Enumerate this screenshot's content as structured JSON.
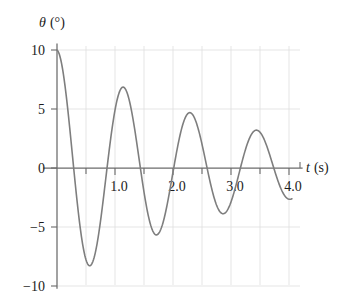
{
  "chart_data": {
    "type": "line",
    "title": "",
    "subtitle": "",
    "xlabel": "t (s)",
    "ylabel": "θ (°)",
    "xlabel_symbol": "t",
    "xlabel_unit": "(s)",
    "ylabel_symbol": "θ",
    "ylabel_unit": "(°)",
    "xlim": [
      0,
      4.35
    ],
    "ylim": [
      -10.6,
      10.6
    ],
    "grid": true,
    "grid_style": "light vertical lines every 0.5 s and light horizontal lines at each labeled theta value",
    "legend": "none",
    "legend_position": "none",
    "curve_color": "#7e7e7e",
    "axis_color": "#6b6b6b",
    "grid_color": "#dedede",
    "x_ticks_major": [
      1.0,
      2.0,
      3.0,
      4.0
    ],
    "x_tick_labels": [
      "1.0",
      "2.0",
      "3.0",
      "4.0"
    ],
    "x_ticks_minor": [
      0.5,
      1.5,
      2.5,
      3.5
    ],
    "y_ticks": [
      10,
      5,
      0,
      -5,
      -10
    ],
    "y_tick_labels": [
      "10",
      "5",
      "0",
      "−5",
      "−10"
    ],
    "model": "theta(t) = 10 * exp(-0.33 t) * cos(2*pi*t/1.15)",
    "amplitude_initial": 10,
    "period": 1.15,
    "decay_constant": 0.33,
    "extrema": [
      {
        "t": 0.0,
        "theta": 10.0,
        "kind": "start-peak"
      },
      {
        "t": 0.57,
        "theta": -9.1,
        "kind": "trough"
      },
      {
        "t": 1.13,
        "theta": 7.4,
        "kind": "peak"
      },
      {
        "t": 1.72,
        "theta": -6.8,
        "kind": "trough"
      },
      {
        "t": 2.3,
        "theta": 5.3,
        "kind": "peak"
      },
      {
        "t": 2.87,
        "theta": -5.2,
        "kind": "trough"
      },
      {
        "t": 3.44,
        "theta": 3.8,
        "kind": "peak"
      },
      {
        "t": 4.05,
        "theta": -3.8,
        "kind": "end"
      }
    ],
    "zero_crossings": [
      0.29,
      0.86,
      1.43,
      2.01,
      2.58,
      3.15,
      3.73
    ],
    "x": [
      0.0,
      0.05,
      0.1,
      0.15,
      0.2,
      0.25,
      0.3,
      0.35,
      0.4,
      0.45,
      0.5,
      0.55,
      0.6,
      0.65,
      0.7,
      0.75,
      0.8,
      0.85,
      0.9,
      0.95,
      1.0,
      1.05,
      1.1,
      1.15,
      1.2,
      1.25,
      1.3,
      1.35,
      1.4,
      1.45,
      1.5,
      1.55,
      1.6,
      1.65,
      1.7,
      1.75,
      1.8,
      1.85,
      1.9,
      1.95,
      2.0,
      2.05,
      2.1,
      2.15,
      2.2,
      2.25,
      2.3,
      2.35,
      2.4,
      2.45,
      2.5,
      2.55,
      2.6,
      2.65,
      2.7,
      2.75,
      2.8,
      2.85,
      2.9,
      2.95,
      3.0,
      3.05,
      3.1,
      3.15,
      3.2,
      3.25,
      3.3,
      3.35,
      3.4,
      3.45,
      3.5,
      3.55,
      3.6,
      3.65,
      3.7,
      3.75,
      3.8,
      3.85,
      3.9,
      3.95,
      4.0,
      4.05
    ],
    "y": [
      10.0,
      9.7,
      8.83,
      7.44,
      5.65,
      3.58,
      1.39,
      -0.78,
      -2.83,
      -4.65,
      -6.14,
      -7.24,
      -7.91,
      -8.13,
      -7.91,
      -7.29,
      -6.31,
      -5.05,
      -3.59,
      -2.03,
      -0.46,
      1.03,
      2.37,
      3.5,
      4.37,
      4.94,
      5.21,
      5.17,
      4.85,
      4.27,
      3.49,
      2.55,
      1.52,
      0.45,
      -0.59,
      -1.58,
      -2.46,
      -3.2,
      -3.76,
      -4.12,
      -4.28,
      -4.24,
      -4.01,
      -3.62,
      -3.09,
      -2.46,
      -1.76,
      -1.03,
      -0.3,
      0.4,
      1.05,
      1.62,
      2.09,
      2.45,
      2.68,
      2.79,
      2.78,
      2.65,
      2.42,
      2.11,
      1.73,
      1.31,
      0.86,
      0.4,
      -0.05,
      -0.47,
      -0.86,
      -1.19,
      -1.46,
      -1.66,
      -1.78,
      -1.83,
      -1.8,
      -1.7,
      -1.54,
      -1.33,
      -1.08,
      -0.81,
      -0.52,
      -0.23,
      0.06,
      0.33,
      0.58
    ]
  },
  "axes": {
    "y_axis_label": "θ (°)",
    "x_axis_label": "t (s)"
  }
}
